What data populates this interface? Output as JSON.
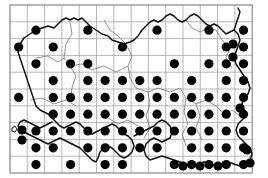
{
  "figure": {
    "title": "",
    "caption": "",
    "type": "distribution-dot-map",
    "region": "Southern Britain"
  },
  "map": {
    "width": 268,
    "height": 178,
    "background_color": "#ffffff",
    "coastline_color": "#111111",
    "region_boundary_color": "#6f6f6f",
    "dot_color": "#000000",
    "dot_radius": 4.6
  },
  "grid": {
    "visible": true,
    "color": "#9a9a9a",
    "origin_x": 10,
    "origin_y": 5,
    "cell_width": 17.3,
    "cell_height": 16.8,
    "columns": 14,
    "rows": 10,
    "x_lines": [
      10,
      27.3,
      44.6,
      61.9,
      79.2,
      96.5,
      113.8,
      131.1,
      148.4,
      165.7,
      183,
      200.3,
      217.6,
      234.9,
      252.2
    ],
    "y_lines": [
      5,
      21.8,
      38.6,
      55.4,
      72.2,
      89,
      105.8,
      122.6,
      139.4,
      156.2,
      173
    ]
  },
  "records": {
    "count": 99,
    "label": "presence record",
    "points": [
      {
        "col": 1,
        "row": 1
      },
      {
        "col": 4,
        "row": 1
      },
      {
        "col": 8,
        "row": 1
      },
      {
        "col": 11,
        "row": 1
      },
      {
        "col": 13,
        "row": 1
      },
      {
        "col": 0,
        "row": 2
      },
      {
        "col": 2,
        "row": 2
      },
      {
        "col": 6,
        "row": 2
      },
      {
        "col": 12,
        "row": 2
      },
      {
        "col": 13,
        "row": 2
      },
      {
        "col": 1,
        "row": 3
      },
      {
        "col": 3,
        "row": 3
      },
      {
        "col": 4,
        "row": 3
      },
      {
        "col": 9,
        "row": 3
      },
      {
        "col": 11,
        "row": 3
      },
      {
        "col": 12,
        "row": 3
      },
      {
        "col": 13,
        "row": 3
      },
      {
        "col": 2,
        "row": 4
      },
      {
        "col": 4,
        "row": 4
      },
      {
        "col": 5,
        "row": 4
      },
      {
        "col": 6,
        "row": 4
      },
      {
        "col": 7,
        "row": 4
      },
      {
        "col": 8,
        "row": 4
      },
      {
        "col": 10,
        "row": 4
      },
      {
        "col": 12,
        "row": 4
      },
      {
        "col": 13,
        "row": 4
      },
      {
        "col": 0,
        "row": 5
      },
      {
        "col": 2,
        "row": 5
      },
      {
        "col": 3,
        "row": 5
      },
      {
        "col": 4,
        "row": 5
      },
      {
        "col": 5,
        "row": 5
      },
      {
        "col": 6,
        "row": 5
      },
      {
        "col": 7,
        "row": 5
      },
      {
        "col": 8,
        "row": 5
      },
      {
        "col": 9,
        "row": 5
      },
      {
        "col": 10,
        "row": 5
      },
      {
        "col": 11,
        "row": 5
      },
      {
        "col": 12,
        "row": 5
      },
      {
        "col": 13,
        "row": 5
      },
      {
        "col": 2,
        "row": 6
      },
      {
        "col": 3,
        "row": 6
      },
      {
        "col": 4,
        "row": 6
      },
      {
        "col": 5,
        "row": 6
      },
      {
        "col": 6,
        "row": 6
      },
      {
        "col": 7,
        "row": 6
      },
      {
        "col": 8,
        "row": 6
      },
      {
        "col": 9,
        "row": 6
      },
      {
        "col": 10,
        "row": 6
      },
      {
        "col": 11,
        "row": 6
      },
      {
        "col": 12,
        "row": 6
      },
      {
        "col": 13,
        "row": 6
      },
      {
        "col": 1,
        "row": 7
      },
      {
        "col": 2,
        "row": 7
      },
      {
        "col": 3,
        "row": 7
      },
      {
        "col": 4,
        "row": 7
      },
      {
        "col": 5,
        "row": 7
      },
      {
        "col": 6,
        "row": 7
      },
      {
        "col": 7,
        "row": 7
      },
      {
        "col": 8,
        "row": 7
      },
      {
        "col": 9,
        "row": 7
      },
      {
        "col": 10,
        "row": 7
      },
      {
        "col": 11,
        "row": 7
      },
      {
        "col": 12,
        "row": 7
      },
      {
        "col": 13,
        "row": 7
      },
      {
        "col": 1,
        "row": 8
      },
      {
        "col": 2,
        "row": 8
      },
      {
        "col": 4,
        "row": 8
      },
      {
        "col": 5,
        "row": 8
      },
      {
        "col": 6,
        "row": 8
      },
      {
        "col": 7,
        "row": 8
      },
      {
        "col": 8,
        "row": 8
      },
      {
        "col": 10,
        "row": 8
      },
      {
        "col": 11,
        "row": 8
      },
      {
        "col": 12,
        "row": 8
      },
      {
        "col": 13,
        "row": 8
      },
      {
        "col": 1,
        "row": 9
      },
      {
        "col": 3,
        "row": 9
      },
      {
        "col": 5,
        "row": 9
      },
      {
        "col": 6,
        "row": 9
      },
      {
        "col": 9,
        "row": 9
      },
      {
        "col": 10,
        "row": 9
      },
      {
        "col": 11,
        "row": 9
      },
      {
        "col": 12,
        "row": 9
      },
      {
        "col": 13,
        "row": 9
      }
    ],
    "offset_points": [
      {
        "x": 22,
        "y": 130,
        "note": "coastal-islet-pair-upper"
      },
      {
        "x": 22,
        "y": 140,
        "note": "coastal-islet-pair-lower"
      },
      {
        "x": 233,
        "y": 44,
        "note": "east-coast-extra"
      },
      {
        "x": 233,
        "y": 57,
        "note": "east-coast-extra-2"
      },
      {
        "x": 240,
        "y": 108,
        "note": "east-coast-extra-3"
      },
      {
        "x": 247,
        "y": 150,
        "note": "south-east-extra"
      },
      {
        "x": 250,
        "y": 163,
        "note": "south-east-corner"
      },
      {
        "x": 200,
        "y": 166,
        "note": "south-coast-extra"
      },
      {
        "x": 183,
        "y": 166,
        "note": "south-coast-extra-2"
      },
      {
        "x": 218,
        "y": 166,
        "note": "south-coast-extra-3"
      }
    ]
  }
}
